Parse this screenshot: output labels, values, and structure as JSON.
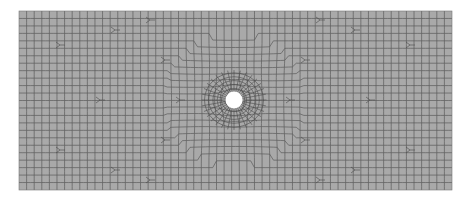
{
  "figure": {
    "type": "finite-element-mesh",
    "plate": {
      "x": 19,
      "y": 11,
      "width": 433,
      "height": 179
    },
    "hole": {
      "cx": 234,
      "cy": 100,
      "r": 8.5
    },
    "cell_size": 7.6,
    "colors": {
      "background": "#ffffff",
      "fill": "#a9a9a9",
      "line": "#5a5a5a",
      "hole": "#ffffff"
    }
  }
}
